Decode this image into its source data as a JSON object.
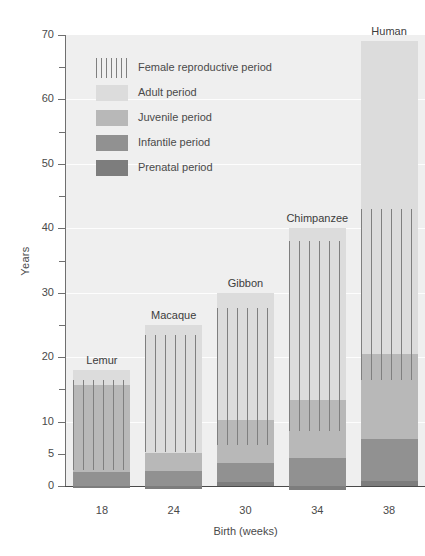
{
  "chart_data": {
    "type": "bar",
    "title": "",
    "xlabel": "Birth (weeks)",
    "ylabel": "Years",
    "ylim": [
      0,
      70
    ],
    "grid": true,
    "stacked": true,
    "legend_position": "upper-left-inside",
    "y_ticks_major": [
      0,
      5,
      10,
      20,
      30,
      40,
      50,
      60,
      70
    ],
    "y_ticks_minor": [
      15,
      25,
      35,
      45,
      55,
      65
    ],
    "categories": [
      "18",
      "24",
      "30",
      "34",
      "38"
    ],
    "category_names": [
      "Lemur",
      "Macaque",
      "Gibbon",
      "Chimpanzee",
      "Human"
    ],
    "series": [
      {
        "name": "Prenatal period",
        "color": "#7d7d7d",
        "values": [
          0.35,
          0.46,
          0.58,
          0.65,
          0.73
        ]
      },
      {
        "name": "Infantile period",
        "color": "#919191",
        "values": [
          2.1,
          2.3,
          2.9,
          4.4,
          6.6
        ]
      },
      {
        "name": "Juvenile period",
        "color": "#b8b8b8",
        "values": [
          13.5,
          2.8,
          6.8,
          9.0,
          13.2
        ]
      },
      {
        "name": "Adult period",
        "color": "#dcdcdc",
        "values": [
          2.4,
          19.9,
          19.7,
          26.6,
          48.5
        ]
      },
      {
        "name": "Female reproductive period",
        "color": "#7f7f7f",
        "hatch": "vertical-lines",
        "ranges": [
          [
            2.5,
            16.5
          ],
          [
            5.3,
            23.5
          ],
          [
            6.3,
            27.6
          ],
          [
            8.5,
            38.0
          ],
          [
            16.5,
            43.0
          ]
        ]
      }
    ],
    "bar_totals": [
      18.0,
      25.0,
      30.0,
      40.0,
      69.0
    ],
    "units": "years"
  },
  "axes": {
    "y_label": "Years",
    "x_label": "Birth (weeks)",
    "y_tick_labels": [
      "70",
      "60",
      "50",
      "40",
      "30",
      "20",
      "10",
      "5",
      "0"
    ],
    "x_tick_labels": [
      "18",
      "24",
      "30",
      "34",
      "38"
    ]
  },
  "legend": {
    "items": [
      {
        "label": "Female reproductive period",
        "swatch": "repro"
      },
      {
        "label": "Adult period",
        "swatch": "adult"
      },
      {
        "label": "Juvenile period",
        "swatch": "juvenile"
      },
      {
        "label": "Infantile period",
        "swatch": "infantile"
      },
      {
        "label": "Prenatal period",
        "swatch": "prenatal"
      }
    ]
  },
  "bar_labels": [
    "Lemur",
    "Macaque",
    "Gibbon",
    "Chimpanzee",
    "Human"
  ],
  "colors": {
    "adult": "#dcdcdc",
    "juvenile": "#b8b8b8",
    "infantile": "#919191",
    "prenatal": "#7d7d7d",
    "repro_hatch": "#7f7f7f",
    "plot_background": "#efefef",
    "axis": "#4a4a4a",
    "text": "#4a4a4a"
  }
}
